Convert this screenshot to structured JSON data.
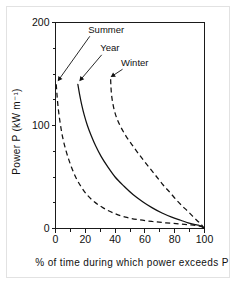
{
  "figure": {
    "caption_visible": false
  },
  "chart_data": {
    "type": "line",
    "title": "",
    "xlabel": "% of time during which power exceeds P",
    "ylabel": "Power P (kW m⁻¹)",
    "xlim": [
      0,
      100
    ],
    "ylim": [
      0,
      200
    ],
    "grid": false,
    "legend_position": "inline-annotations",
    "x_ticks": [
      0,
      20,
      40,
      60,
      80,
      100
    ],
    "x_ticklabels": [
      "0",
      "20",
      "40",
      "60",
      "80",
      "100"
    ],
    "x_minor_ticks": [
      10,
      30,
      50,
      70,
      90
    ],
    "y_ticks": [
      0,
      100,
      200
    ],
    "y_ticklabels": [
      "0",
      "100",
      "200"
    ],
    "y_minor_ticks": [
      25,
      50,
      75,
      125,
      150,
      175
    ],
    "series": [
      {
        "name": "Summer",
        "style": "dashed",
        "points": [
          [
            0.5,
            140
          ],
          [
            1.0,
            130
          ],
          [
            1.6,
            120
          ],
          [
            2.4,
            110
          ],
          [
            3.4,
            100
          ],
          [
            4.6,
            90
          ],
          [
            6.2,
            80
          ],
          [
            8.2,
            70
          ],
          [
            10.6,
            60
          ],
          [
            13.5,
            50
          ],
          [
            17.0,
            41
          ],
          [
            21.0,
            33
          ],
          [
            26.0,
            26
          ],
          [
            32.0,
            20
          ],
          [
            39.0,
            15
          ],
          [
            47.0,
            11
          ],
          [
            56.0,
            8.5
          ],
          [
            65.0,
            6.8
          ],
          [
            74.0,
            5.5
          ],
          [
            83.0,
            4.5
          ],
          [
            91.0,
            3.5
          ],
          [
            96.0,
            2.6
          ],
          [
            98.5,
            1.4
          ],
          [
            99.5,
            0
          ]
        ]
      },
      {
        "name": "Year",
        "style": "solid",
        "points": [
          [
            15.0,
            140
          ],
          [
            16.2,
            130
          ],
          [
            17.6,
            120
          ],
          [
            19.3,
            110
          ],
          [
            21.4,
            100
          ],
          [
            24.0,
            90
          ],
          [
            27.0,
            80
          ],
          [
            30.6,
            70
          ],
          [
            35.0,
            60
          ],
          [
            40.0,
            50
          ],
          [
            46.0,
            41
          ],
          [
            52.0,
            33
          ],
          [
            58.5,
            26
          ],
          [
            65.0,
            20
          ],
          [
            71.5,
            15
          ],
          [
            78.0,
            11
          ],
          [
            84.0,
            8.0
          ],
          [
            89.0,
            5.5
          ],
          [
            93.0,
            4.0
          ],
          [
            96.0,
            3.2
          ],
          [
            98.0,
            2.4
          ],
          [
            99.2,
            1.2
          ],
          [
            99.8,
            0
          ]
        ]
      },
      {
        "name": "Winter",
        "style": "dashed",
        "points": [
          [
            37.0,
            145
          ],
          [
            37.2,
            138
          ],
          [
            37.6,
            130
          ],
          [
            38.4,
            122
          ],
          [
            39.6,
            114
          ],
          [
            41.4,
            106
          ],
          [
            44.0,
            98
          ],
          [
            47.2,
            90
          ],
          [
            51.0,
            82
          ],
          [
            55.0,
            74
          ],
          [
            59.2,
            66
          ],
          [
            63.6,
            58
          ],
          [
            68.0,
            50
          ],
          [
            72.4,
            42
          ],
          [
            76.8,
            35
          ],
          [
            81.0,
            28
          ],
          [
            85.0,
            22
          ],
          [
            88.6,
            17
          ],
          [
            92.0,
            12
          ],
          [
            94.8,
            8
          ],
          [
            97.0,
            5
          ],
          [
            98.6,
            2.5
          ],
          [
            99.6,
            0
          ]
        ]
      }
    ],
    "annotations": [
      {
        "label": "Summer",
        "label_x": 22,
        "label_y": 190,
        "target_x": 1.5,
        "target_y": 143
      },
      {
        "label": "Year",
        "label_x": 30,
        "label_y": 172,
        "target_x": 16,
        "target_y": 143
      },
      {
        "label": "Winter",
        "label_x": 44,
        "label_y": 158,
        "target_x": 37,
        "target_y": 147
      }
    ]
  }
}
